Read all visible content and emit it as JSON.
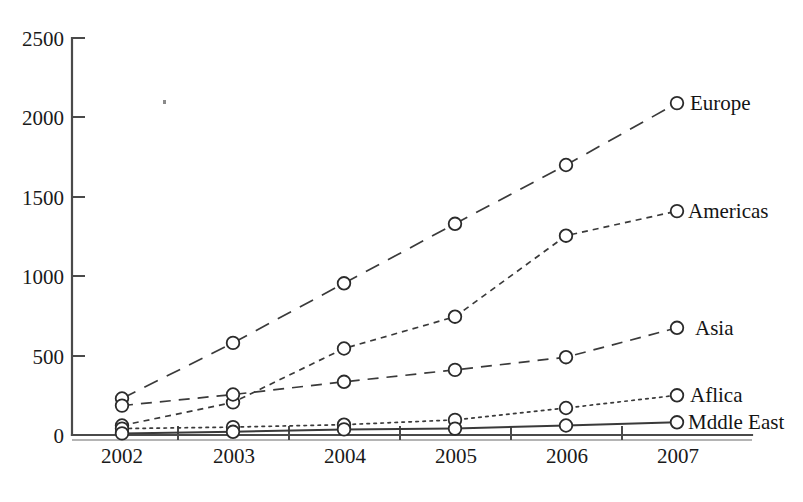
{
  "chart_data": {
    "type": "line",
    "title": "",
    "subtitle": "",
    "xlabel": "",
    "ylabel": "",
    "categories": [
      "2002",
      "2003",
      "2004",
      "2005",
      "2006",
      "2007"
    ],
    "x_tick_labels": [
      "2002",
      "2003",
      "2004",
      "2005",
      "2006",
      "2007"
    ],
    "y_tick_labels": [
      "0",
      "500",
      "1000",
      "1500",
      "2000",
      "2500"
    ],
    "y_ticks": [
      0,
      500,
      1000,
      1500,
      2000,
      2500
    ],
    "ylim": [
      0,
      2500
    ],
    "grid": false,
    "legend_position": "right-inline-end-of-line",
    "series": [
      {
        "name": "Europe",
        "label": "Europe",
        "line_style": "long-dashed",
        "marker": "open-circle",
        "values": [
          230,
          580,
          955,
          1330,
          1700,
          2090
        ]
      },
      {
        "name": "Americas",
        "label": "Americas",
        "line_style": "short-dashed",
        "marker": "open-circle",
        "values": [
          60,
          205,
          545,
          745,
          1255,
          1410
        ]
      },
      {
        "name": "Asia",
        "label": "Asia",
        "line_style": "medium-dashed",
        "marker": "open-circle",
        "values": [
          185,
          255,
          335,
          410,
          490,
          675
        ]
      },
      {
        "name": "Aflica",
        "label": "Aflica",
        "line_style": "dotted",
        "marker": "open-circle",
        "values": [
          40,
          50,
          65,
          95,
          170,
          250
        ]
      },
      {
        "name": "Mddle East",
        "label": "Mddle East",
        "line_style": "solid",
        "marker": "open-circle",
        "values": [
          10,
          20,
          35,
          40,
          60,
          80
        ]
      }
    ]
  },
  "colors": {
    "background": "#ffffff",
    "axis": "#4a4a4a",
    "line": "#3a3a3a",
    "text": "#141414",
    "marker_fill": "#ffffff"
  }
}
